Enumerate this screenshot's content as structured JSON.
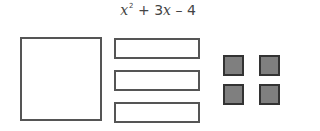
{
  "expression": {
    "var1": "x",
    "exp": "2",
    "mid": " + 3",
    "var2": "x",
    "tail": " – 4"
  },
  "tiles": {
    "x_squared": {
      "count": 1,
      "label": "x²"
    },
    "x": {
      "count": 3,
      "label": "x"
    },
    "negative_one": {
      "count": 4,
      "label": "-1",
      "color": "#7f7f7f"
    }
  }
}
